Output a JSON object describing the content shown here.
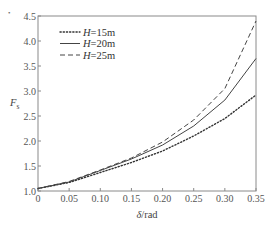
{
  "chart_data": {
    "type": "line",
    "title": "",
    "xlabel": "δ / rad",
    "ylabel": "F_s",
    "xlim": [
      0,
      0.35
    ],
    "ylim": [
      1.0,
      4.5
    ],
    "grid": false,
    "legend_position": "upper left",
    "x_ticks": [
      "0",
      "0.05",
      "0.10",
      "0.15",
      "0.20",
      "0.25",
      "0.30",
      "0.35"
    ],
    "y_ticks": [
      "1.0",
      "1.5",
      "2.0",
      "2.5",
      "3.0",
      "3.5",
      "4.0",
      "4.5"
    ],
    "x": [
      0,
      0.05,
      0.1,
      0.15,
      0.2,
      0.25,
      0.3,
      0.35
    ],
    "series": [
      {
        "name": "H=15m",
        "label_var": "H",
        "label_value": "=15m",
        "style": "dotted",
        "color": "#333333",
        "values": [
          1.05,
          1.17,
          1.37,
          1.57,
          1.8,
          2.1,
          2.45,
          2.92
        ]
      },
      {
        "name": "H=20m",
        "label_var": "H",
        "label_value": "=20m",
        "style": "solid",
        "color": "#444444",
        "values": [
          1.05,
          1.18,
          1.41,
          1.64,
          1.92,
          2.3,
          2.82,
          3.65
        ]
      },
      {
        "name": "H=25m",
        "label_var": "H",
        "label_value": "=25m",
        "style": "dashed",
        "color": "#444444",
        "values": [
          1.05,
          1.19,
          1.42,
          1.66,
          1.98,
          2.42,
          3.05,
          4.4
        ]
      }
    ]
  },
  "marker": "•"
}
